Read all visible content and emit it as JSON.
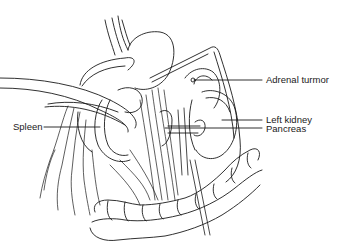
{
  "figure": {
    "type": "anatomical line drawing",
    "labels": [
      {
        "id": "adrenal",
        "text": "Adrenal turmor"
      },
      {
        "id": "kidney",
        "text": "Left kidney"
      },
      {
        "id": "pancreas",
        "text": "Pancreas"
      },
      {
        "id": "spleen",
        "text": "Spleen"
      }
    ]
  },
  "colors": {
    "ink": "#1a1a1a",
    "background": "#ffffff"
  }
}
